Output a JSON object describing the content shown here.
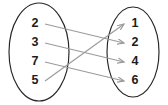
{
  "diagram": {
    "type": "mapping-diagram",
    "title": "",
    "domain_set": {
      "name": "left-oval",
      "elements": [
        {
          "label": "2",
          "x": 35,
          "y": 24
        },
        {
          "label": "3",
          "x": 35,
          "y": 43
        },
        {
          "label": "7",
          "x": 35,
          "y": 62
        },
        {
          "label": "5",
          "x": 35,
          "y": 81
        }
      ]
    },
    "codomain_set": {
      "name": "right-oval",
      "elements": [
        {
          "label": "1",
          "x": 135,
          "y": 24
        },
        {
          "label": "2",
          "x": 135,
          "y": 43
        },
        {
          "label": "4",
          "x": 135,
          "y": 62
        },
        {
          "label": "6",
          "x": 135,
          "y": 81
        }
      ]
    },
    "ovals": [
      {
        "name": "left-oval",
        "cx": 39,
        "cy": 52,
        "rx": 30,
        "ry": 49
      },
      {
        "name": "right-oval",
        "cx": 133,
        "cy": 52,
        "rx": 26,
        "ry": 45
      }
    ],
    "arrows": [
      {
        "name": "arrow-2-to-2",
        "from": "2",
        "to": "2",
        "x1": 45,
        "y1": 24,
        "x2": 124,
        "y2": 43
      },
      {
        "name": "arrow-3-to-4",
        "from": "3",
        "to": "4",
        "x1": 45,
        "y1": 43,
        "x2": 124,
        "y2": 62
      },
      {
        "name": "arrow-7-to-6",
        "from": "7",
        "to": "6",
        "x1": 45,
        "y1": 62,
        "x2": 124,
        "y2": 81
      },
      {
        "name": "arrow-5-to-1",
        "from": "5",
        "to": "1",
        "x1": 45,
        "y1": 81,
        "x2": 124,
        "y2": 24
      }
    ],
    "colors": {
      "oval_stroke": "#262626",
      "arrow_stroke": "#9a9a9a",
      "label_fill": "#1c1c1c",
      "background": "#ffffff"
    }
  }
}
